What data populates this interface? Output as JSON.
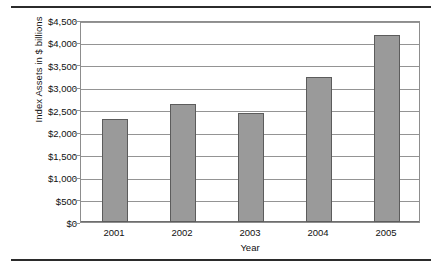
{
  "figure": {
    "bar_color": "#9A9A9A",
    "bar_border_color": "#5C5C5C",
    "grid_color": "#949494",
    "rule_color": "#2B2B2B"
  },
  "chart_data": {
    "type": "bar",
    "title": "",
    "xlabel": "Year",
    "ylabel": "Index Assets in $ billions",
    "categories": [
      "2001",
      "2002",
      "2003",
      "2004",
      "2005"
    ],
    "values": [
      2300,
      2620,
      2420,
      3230,
      4160
    ],
    "ylim": [
      0,
      4500
    ],
    "ytick_step": 500,
    "ytick_labels": [
      "$0",
      "$500",
      "$1,000",
      "$1,500",
      "$2,000",
      "$2,500",
      "$3,000",
      "$3,500",
      "$4,000",
      "$4,500"
    ],
    "ytick_values": [
      0,
      500,
      1000,
      1500,
      2000,
      2500,
      3000,
      3500,
      4000,
      4500
    ],
    "grid": "horizontal",
    "legend": "none",
    "series": [
      {
        "name": "Index Assets",
        "values": [
          2300,
          2620,
          2420,
          3230,
          4160
        ]
      }
    ]
  }
}
